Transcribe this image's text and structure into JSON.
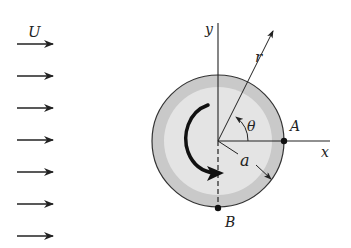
{
  "diagram": {
    "flow": {
      "label": "U",
      "arrow_count": 7,
      "arrow_y": [
        44,
        76,
        108,
        140,
        172,
        204,
        236
      ]
    },
    "cylinder": {
      "center": [
        218,
        141
      ],
      "radius": 66,
      "outer_color": "#c9c9c9",
      "inner_color": "#e4e4e4",
      "rotation": "clockwise"
    },
    "axes": {
      "x_label": "x",
      "y_label": "y"
    },
    "labels": {
      "radius_vector": "r",
      "angle": "θ",
      "cylinder_radius": "a",
      "point_a": "A",
      "point_b": "B"
    },
    "colors": {
      "line": "#222222",
      "background": "#ffffff"
    }
  }
}
